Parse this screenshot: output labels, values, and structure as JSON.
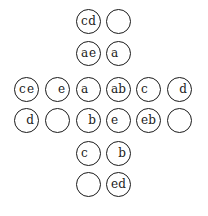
{
  "diagram": {
    "cells": [
      {
        "id": "r0c2",
        "x": 76,
        "y": 9,
        "left": "c",
        "right": "d"
      },
      {
        "id": "r0c3",
        "x": 106,
        "y": 9,
        "left": "",
        "right": ""
      },
      {
        "id": "r1c2",
        "x": 76,
        "y": 41,
        "left": "a",
        "right": "e"
      },
      {
        "id": "r1c3",
        "x": 106,
        "y": 41,
        "left": "a",
        "right": ""
      },
      {
        "id": "r2c0",
        "x": 14,
        "y": 77,
        "left": "c",
        "right": "e"
      },
      {
        "id": "r2c1",
        "x": 45,
        "y": 77,
        "left": "",
        "right": "e"
      },
      {
        "id": "r2c2",
        "x": 76,
        "y": 77,
        "left": "a",
        "right": ""
      },
      {
        "id": "r2c3",
        "x": 106,
        "y": 77,
        "left": "a",
        "right": "b"
      },
      {
        "id": "r2c4",
        "x": 136,
        "y": 77,
        "left": "c",
        "right": ""
      },
      {
        "id": "r2c5",
        "x": 167,
        "y": 77,
        "left": "",
        "right": "d"
      },
      {
        "id": "r3c0",
        "x": 14,
        "y": 108,
        "left": "",
        "right": "d"
      },
      {
        "id": "r3c1",
        "x": 45,
        "y": 108,
        "left": "",
        "right": ""
      },
      {
        "id": "r3c2",
        "x": 76,
        "y": 108,
        "left": "",
        "right": "b"
      },
      {
        "id": "r3c3",
        "x": 106,
        "y": 108,
        "left": "e",
        "right": ""
      },
      {
        "id": "r3c4",
        "x": 136,
        "y": 108,
        "left": "e",
        "right": "b"
      },
      {
        "id": "r3c5",
        "x": 167,
        "y": 108,
        "left": "",
        "right": ""
      },
      {
        "id": "r4c2",
        "x": 76,
        "y": 141,
        "left": "c",
        "right": ""
      },
      {
        "id": "r4c3",
        "x": 106,
        "y": 141,
        "left": "",
        "right": "b"
      },
      {
        "id": "r5c2",
        "x": 76,
        "y": 172,
        "left": "",
        "right": ""
      },
      {
        "id": "r5c3",
        "x": 106,
        "y": 172,
        "left": "e",
        "right": "d"
      }
    ]
  }
}
